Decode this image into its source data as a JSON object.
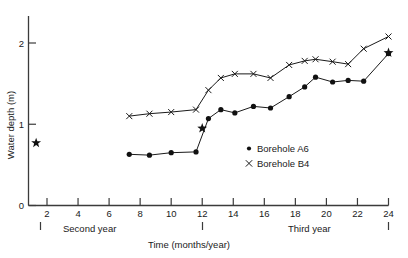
{
  "chart_data": {
    "type": "line",
    "title": "",
    "xlabel": "Time (months/year)",
    "ylabel": "Water depth (m)",
    "xlim": [
      0,
      25
    ],
    "ylim": [
      0,
      2.25
    ],
    "grid": false,
    "legend_position": "center-right",
    "x_ticks": [
      2,
      4,
      6,
      8,
      10,
      12,
      14,
      16,
      18,
      20,
      22,
      24
    ],
    "y_ticks": [
      0,
      1,
      2
    ],
    "annotations": [
      {
        "name": "second-year",
        "text": "Second year",
        "x": 6.0,
        "y": -0.32
      },
      {
        "name": "third-year",
        "text": "Third year",
        "x": 19.0,
        "y": -0.32
      }
    ],
    "series": [
      {
        "name": "Borehole A6",
        "marker": "dot",
        "x": [
          7.3,
          8.6,
          10.0,
          11.6,
          12.4,
          13.2,
          14.1,
          15.3,
          16.4,
          17.6,
          18.6,
          19.3,
          20.4,
          21.4,
          22.4,
          24.0
        ],
        "values": [
          0.63,
          0.62,
          0.65,
          0.66,
          1.07,
          1.18,
          1.14,
          1.22,
          1.2,
          1.34,
          1.46,
          1.58,
          1.52,
          1.54,
          1.53,
          1.87
        ]
      },
      {
        "name": "Borehole B4",
        "marker": "cross",
        "x": [
          7.3,
          8.6,
          10.0,
          11.6,
          12.4,
          13.2,
          14.1,
          15.3,
          16.4,
          17.6,
          18.6,
          19.3,
          20.4,
          21.4,
          22.4,
          24.0
        ],
        "values": [
          1.1,
          1.13,
          1.15,
          1.18,
          1.42,
          1.57,
          1.62,
          1.62,
          1.57,
          1.73,
          1.78,
          1.8,
          1.77,
          1.74,
          1.93,
          2.08
        ]
      },
      {
        "name": "Star markers",
        "marker": "star",
        "x": [
          1.3,
          12.0,
          24.0
        ],
        "values": [
          0.77,
          0.95,
          1.88
        ]
      }
    ]
  },
  "legend": {
    "items": [
      {
        "label": "Borehole A6",
        "marker": "dot"
      },
      {
        "label": "Borehole B4",
        "marker": "cross"
      }
    ]
  },
  "y_tick_labels": [
    "0",
    "1",
    "2"
  ],
  "x_tick_labels": [
    "2",
    "4",
    "6",
    "8",
    "10",
    "12",
    "14",
    "16",
    "18",
    "20",
    "22",
    "24"
  ]
}
